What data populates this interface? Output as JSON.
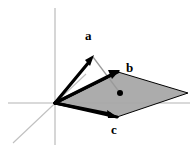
{
  "figure": {
    "width": 195,
    "height": 150,
    "background_color": "#ffffff"
  },
  "colors": {
    "vector_stroke": "#000000",
    "axis_stroke": "#b4b4b4",
    "plane_fill": "#a8a8a8",
    "plane_edge": "#000000",
    "projection_line": "#9a9a9a",
    "dot_fill": "#000000",
    "label_color": "#000000"
  },
  "origin": {
    "x": 55,
    "y": 103
  },
  "axes": [
    {
      "name": "vertical-axis",
      "x1": 55,
      "y1": 8,
      "x2": 55,
      "y2": 145,
      "color": "#b4b4b4",
      "width": 1.1
    },
    {
      "name": "horizontal-axis",
      "x1": 8,
      "y1": 103,
      "x2": 190,
      "y2": 103,
      "color": "#b4b4b4",
      "width": 1.1
    },
    {
      "name": "depth-axis",
      "x1": 13,
      "y1": 143,
      "x2": 86,
      "y2": 74,
      "color": "#c0c0c0",
      "width": 1.1
    }
  ],
  "plane": {
    "name": "spanned-plane",
    "points": "55,103 118,72 188,93 117,117",
    "fill": "#a8a8a8",
    "fill_opacity": 0.95,
    "edge_color": "#000000"
  },
  "vectors": [
    {
      "id": "a",
      "label": "a",
      "x1": 55,
      "y1": 103,
      "x2": 93,
      "y2": 57,
      "label_x": 85,
      "label_y": 30,
      "stroke_width": 3.2,
      "head_length": 11,
      "head_width": 8
    },
    {
      "id": "b",
      "label": "b",
      "x1": 55,
      "y1": 103,
      "x2": 118,
      "y2": 72,
      "label_x": 126,
      "label_y": 62,
      "stroke_width": 3.2,
      "head_length": 11,
      "head_width": 8
    },
    {
      "id": "c",
      "label": "c",
      "x1": 55,
      "y1": 103,
      "x2": 117,
      "y2": 117,
      "label_x": 111,
      "label_y": 124,
      "stroke_width": 3.2,
      "head_length": 11,
      "head_width": 8
    }
  ],
  "projection": {
    "name": "projection-drop-line",
    "from_x": 93,
    "from_y": 57,
    "to_x": 120,
    "to_y": 93,
    "color": "#9a9a9a",
    "width": 1.2
  },
  "projection_point": {
    "name": "projection-point",
    "x": 120,
    "y": 93,
    "radius": 3.0,
    "color": "#000000"
  }
}
